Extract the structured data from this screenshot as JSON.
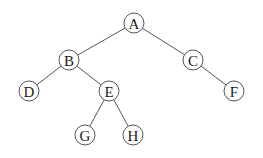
{
  "diagram": {
    "type": "binary-tree",
    "colors": {
      "stroke": "#555555",
      "text": "#1a1a1a",
      "background": "#ffffff"
    },
    "node_radius": 10,
    "nodes": [
      {
        "id": "A",
        "label": "A",
        "x": 134,
        "y": 23
      },
      {
        "id": "B",
        "label": "B",
        "x": 69,
        "y": 60
      },
      {
        "id": "C",
        "label": "C",
        "x": 193,
        "y": 60
      },
      {
        "id": "D",
        "label": "D",
        "x": 29,
        "y": 91
      },
      {
        "id": "E",
        "label": "E",
        "x": 109,
        "y": 91
      },
      {
        "id": "F",
        "label": "F",
        "x": 234,
        "y": 91
      },
      {
        "id": "G",
        "label": "G",
        "x": 85,
        "y": 135
      },
      {
        "id": "H",
        "label": "H",
        "x": 133,
        "y": 135
      }
    ],
    "edges": [
      {
        "from": "A",
        "to": "B"
      },
      {
        "from": "A",
        "to": "C"
      },
      {
        "from": "B",
        "to": "D"
      },
      {
        "from": "B",
        "to": "E"
      },
      {
        "from": "C",
        "to": "F"
      },
      {
        "from": "E",
        "to": "G"
      },
      {
        "from": "E",
        "to": "H"
      }
    ]
  }
}
